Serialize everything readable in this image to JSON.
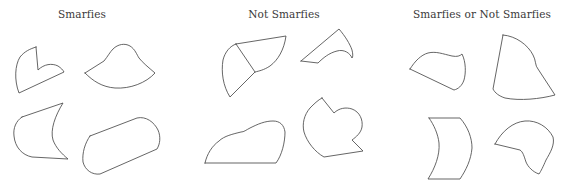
{
  "panels": [
    {
      "id": "smarfies",
      "title": "Smarfies",
      "shape_count": 4
    },
    {
      "id": "not-smarfies",
      "title": "Not Smarfies",
      "shape_count": 4
    },
    {
      "id": "smarfies-or-not",
      "title": "Smarfies or Not Smarfies",
      "shape_count": 4
    }
  ],
  "colors": {
    "background": "#ffffff",
    "stroke": "#4a4a4a",
    "title_text": "#3a3a3a"
  }
}
